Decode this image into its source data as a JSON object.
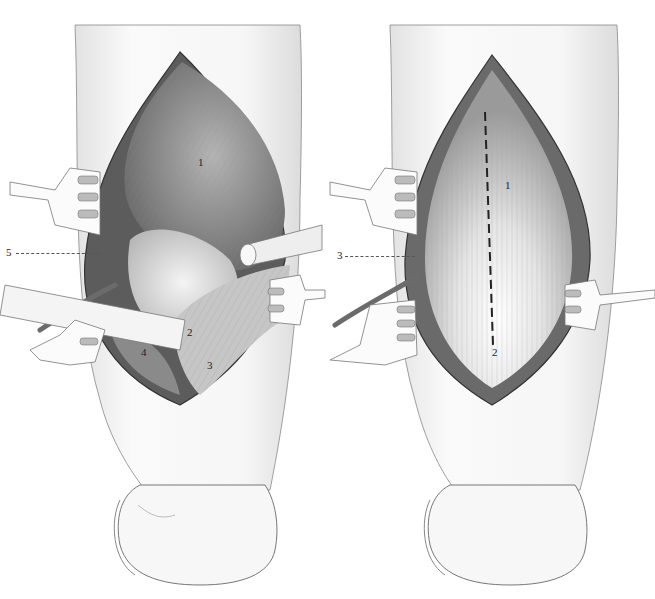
{
  "figure": {
    "panels": [
      {
        "id": "left",
        "description": "Forearm incision with muscle retracted, retractors in place",
        "labels": [
          {
            "text": "1",
            "x": 198,
            "y": 162
          },
          {
            "text": "2",
            "x": 187,
            "y": 332
          },
          {
            "text": "3",
            "x": 207,
            "y": 365
          },
          {
            "text": "4",
            "x": 141,
            "y": 352
          },
          {
            "text": "5",
            "x": 7,
            "y": 247,
            "leader_to": 100
          }
        ]
      },
      {
        "id": "right",
        "description": "Forearm incision with fascia exposed and dashed incision line",
        "labels": [
          {
            "text": "1",
            "x": 505,
            "y": 185
          },
          {
            "text": "2",
            "x": 492,
            "y": 352
          },
          {
            "text": "3",
            "x": 337,
            "y": 252,
            "leader_to": 415
          }
        ]
      }
    ],
    "colors": {
      "outline": "#3a3a3a",
      "skin": "#f4f4f4",
      "muscle_dark": "#6e6e6e",
      "muscle_mid": "#a8a8a8",
      "fascia_light": "#e6e6e6",
      "retractor": "#fafafa"
    }
  }
}
